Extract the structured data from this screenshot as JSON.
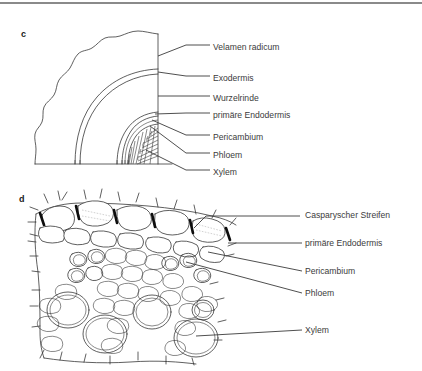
{
  "figure": {
    "background_color": "#ffffff",
    "ink_color": "#2b2b2b",
    "text_color": "#3b3b3b",
    "rule_color": "#8a8a8a",
    "casparian_color": "#0d0d0d"
  },
  "panels": [
    {
      "letter": "c",
      "name": "root-cross-section-overview",
      "labels": [
        {
          "text": "Velamen radicum",
          "x": 213,
          "y": 42
        },
        {
          "text": "Exodermis",
          "x": 213,
          "y": 73
        },
        {
          "text": "Wurzelrinde",
          "x": 213,
          "y": 93
        },
        {
          "text": "primäre Endodermis",
          "x": 213,
          "y": 110
        },
        {
          "text": "Pericambium",
          "x": 213,
          "y": 132
        },
        {
          "text": "Phloem",
          "x": 213,
          "y": 150
        },
        {
          "text": "Xylem",
          "x": 213,
          "y": 167
        }
      ]
    },
    {
      "letter": "d",
      "name": "stele-detail",
      "labels": [
        {
          "text": "Casparyscher Streifen",
          "x": 305,
          "y": 210
        },
        {
          "text": "primäre Endodermis",
          "x": 305,
          "y": 238
        },
        {
          "text": "Pericambium",
          "x": 305,
          "y": 266
        },
        {
          "text": "Phloem",
          "x": 305,
          "y": 288
        },
        {
          "text": "Xylem",
          "x": 305,
          "y": 325
        }
      ]
    }
  ]
}
